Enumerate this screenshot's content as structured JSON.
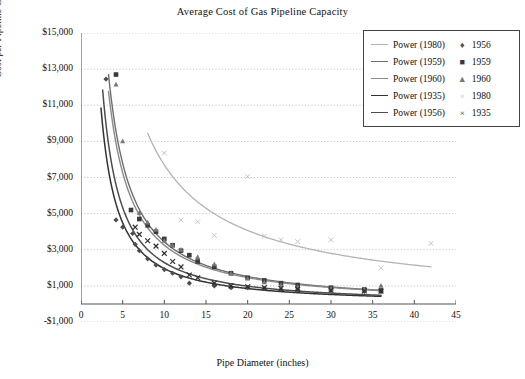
{
  "chart_data": {
    "type": "scatter",
    "title": "Average Cost of Gas Pipeline Capacity",
    "xlabel": "Pipe Diameter (inches)",
    "ylabel": "Cost per Pipeline Cross Section per Mile",
    "xlim": [
      0,
      45
    ],
    "ylim": [
      -1000,
      15000
    ],
    "xticks": [
      "0",
      "5",
      "10",
      "15",
      "20",
      "25",
      "30",
      "35",
      "40",
      "45"
    ],
    "yticks": [
      "$15,000",
      "$13,000",
      "$11,000",
      "$9,000",
      "$7,000",
      "$5,000",
      "$3,000",
      "$1,000",
      "-$1,000"
    ],
    "grid": "horizontal-dotted",
    "legend_position": "top-right",
    "legend_lines": [
      {
        "label": "Power (1980)",
        "color": "#b3b3b3"
      },
      {
        "label": "Power (1959)",
        "color": "#6e6e6e"
      },
      {
        "label": "Power (1960)",
        "color": "#8a8a8a"
      },
      {
        "label": "Power (1935)",
        "color": "#333333"
      },
      {
        "label": "Power (1956)",
        "color": "#4d4d4d"
      }
    ],
    "legend_markers": [
      {
        "label": "1956",
        "glyph": "♦",
        "color": "#4d4d4d"
      },
      {
        "label": "1959",
        "glyph": "■",
        "color": "#3a3a3a"
      },
      {
        "label": "1960",
        "glyph": "▲",
        "color": "#777777"
      },
      {
        "label": "1980",
        "glyph": "×",
        "color": "#bfbfbf"
      },
      {
        "label": "1935",
        "glyph": "×",
        "color": "#2e2e2e"
      }
    ],
    "series": [
      {
        "name": "1956",
        "marker": "diamond",
        "color": "#4d4d4d",
        "points": [
          [
            3.0,
            12450
          ],
          [
            4.2,
            4650
          ],
          [
            5.0,
            4250
          ],
          [
            6.2,
            3900
          ],
          [
            6.5,
            3300
          ],
          [
            7.0,
            2950
          ],
          [
            8.0,
            2500
          ],
          [
            9.0,
            2150
          ],
          [
            10.0,
            1900
          ],
          [
            11.0,
            1700
          ],
          [
            12.0,
            1500
          ],
          [
            13.0,
            1150
          ],
          [
            16.0,
            1000
          ],
          [
            18.0,
            900
          ],
          [
            20.0,
            900
          ],
          [
            22.0,
            850
          ],
          [
            24.0,
            800
          ],
          [
            26.0,
            780
          ],
          [
            30.0,
            740
          ],
          [
            34.0,
            700
          ],
          [
            36.0,
            680
          ]
        ]
      },
      {
        "name": "1959",
        "marker": "square",
        "color": "#3a3a3a",
        "points": [
          [
            4.2,
            12700
          ],
          [
            6.0,
            5200
          ],
          [
            7.0,
            4700
          ],
          [
            8.0,
            4350
          ],
          [
            9.0,
            4000
          ],
          [
            10.0,
            3600
          ],
          [
            11.0,
            3250
          ],
          [
            12.0,
            2950
          ],
          [
            13.0,
            2700
          ],
          [
            14.0,
            2350
          ],
          [
            16.0,
            2050
          ],
          [
            18.0,
            1700
          ],
          [
            20.0,
            1450
          ],
          [
            22.0,
            1300
          ],
          [
            24.0,
            1150
          ],
          [
            26.0,
            1050
          ],
          [
            30.0,
            900
          ],
          [
            34.0,
            800
          ],
          [
            36.0,
            750
          ]
        ]
      },
      {
        "name": "1960",
        "marker": "triangle",
        "color": "#777777",
        "points": [
          [
            4.2,
            12150
          ],
          [
            5.0,
            9000
          ],
          [
            7.0,
            5050
          ],
          [
            8.0,
            4500
          ],
          [
            9.0,
            4100
          ],
          [
            10.0,
            3500
          ],
          [
            11.0,
            3250
          ],
          [
            12.0,
            3000
          ],
          [
            14.0,
            2600
          ],
          [
            16.0,
            2200
          ],
          [
            18.0,
            1700
          ],
          [
            20.0,
            1400
          ],
          [
            22.0,
            1200
          ],
          [
            24.0,
            1050
          ],
          [
            26.0,
            950
          ],
          [
            30.0,
            850
          ],
          [
            34.0,
            800
          ],
          [
            36.0,
            1000
          ]
        ]
      },
      {
        "name": "1980",
        "marker": "cross-light",
        "color": "#bfbfbf",
        "points": [
          [
            10.0,
            8350
          ],
          [
            12.0,
            4650
          ],
          [
            14.0,
            4550
          ],
          [
            16.0,
            3800
          ],
          [
            20.0,
            7050
          ],
          [
            22.0,
            3750
          ],
          [
            24.0,
            3550
          ],
          [
            26.0,
            3450
          ],
          [
            30.0,
            3550
          ],
          [
            36.0,
            2000
          ],
          [
            42.0,
            3350
          ]
        ]
      },
      {
        "name": "1935",
        "marker": "cross-dark",
        "color": "#2e2e2e",
        "points": [
          [
            6.5,
            4250
          ],
          [
            7.0,
            3850
          ],
          [
            8.0,
            3500
          ],
          [
            9.0,
            3200
          ],
          [
            10.0,
            2800
          ],
          [
            11.0,
            2350
          ],
          [
            12.0,
            2050
          ],
          [
            13.0,
            1600
          ],
          [
            14.0,
            1450
          ],
          [
            16.0,
            1150
          ],
          [
            18.0,
            1000
          ],
          [
            20.0,
            950
          ],
          [
            22.0,
            900
          ],
          [
            24.0,
            850
          ],
          [
            26.0,
            820
          ],
          [
            30.0,
            760
          ],
          [
            34.0,
            720
          ],
          [
            36.0,
            700
          ]
        ]
      }
    ],
    "fitted_curves": [
      {
        "name": "Power (1980)",
        "color": "#b3b3b3",
        "width": 1.3,
        "a": 64000,
        "b": -0.92,
        "xrange": [
          8.0,
          42.0
        ]
      },
      {
        "name": "Power (1959)",
        "color": "#6e6e6e",
        "width": 1.4,
        "a": 52000,
        "b": -1.18,
        "xrange": [
          3.3,
          36.0
        ]
      },
      {
        "name": "Power (1960)",
        "color": "#8a8a8a",
        "width": 1.4,
        "a": 47000,
        "b": -1.16,
        "xrange": [
          3.3,
          36.0
        ]
      },
      {
        "name": "Power (1935)",
        "color": "#333333",
        "width": 1.5,
        "a": 31000,
        "b": -1.2,
        "xrange": [
          2.4,
          36.0
        ]
      },
      {
        "name": "Power (1956)",
        "color": "#4d4d4d",
        "width": 1.5,
        "a": 38000,
        "b": -1.22,
        "xrange": [
          2.6,
          36.0
        ]
      }
    ]
  }
}
